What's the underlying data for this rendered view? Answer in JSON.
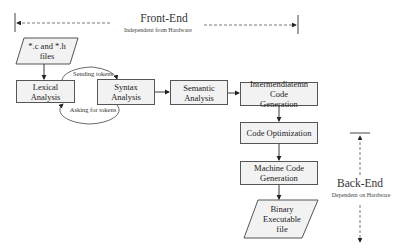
{
  "front_end": {
    "title": "Front-End",
    "subtitle": "Independent from Hardware"
  },
  "back_end": {
    "title": "Back-End",
    "subtitle": "Dependent on Hardware"
  },
  "nodes": {
    "source_files": {
      "line1": "*.c and *.h",
      "line2": "files"
    },
    "lexical": {
      "line1": "Lexical",
      "line2": "Analysis"
    },
    "syntax": {
      "line1": "Syntax",
      "line2": "Analysis"
    },
    "semantic": {
      "line1": "Semantic",
      "line2": "Analysis"
    },
    "intermediate": {
      "line1": "Intermendiatemn Code",
      "line2": "Generation"
    },
    "optimization": {
      "line1": "Code Optimization"
    },
    "machine": {
      "line1": "Machine Code",
      "line2": "Generation"
    },
    "binary": {
      "line1": "Binary",
      "line2": "Executable",
      "line3": "file"
    }
  },
  "edges": {
    "sending_tokens": "Sending tokens",
    "asking_tokens": "Asking for tokens"
  },
  "colors": {
    "box_fill": "#f2f2f2",
    "stroke": "#555555"
  }
}
